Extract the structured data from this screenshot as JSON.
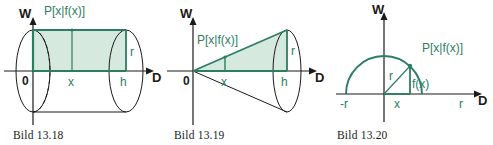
{
  "page": {
    "background": "#ffffff",
    "width": 493,
    "height": 145
  },
  "style": {
    "green_stroke": "#2d7d62",
    "green_fill": "#d6e9df",
    "black_stroke": "#1a1a1a"
  },
  "figures": [
    {
      "id": "cylinder",
      "caption": "Bild 13.18",
      "axis_vertical_label": "W",
      "axis_horizontal_label": "D",
      "origin_label": "0",
      "point_label": "P[x|f(x)]",
      "x_label": "x",
      "h_label": "h",
      "r_label": "r",
      "shape": "cylinder"
    },
    {
      "id": "cone",
      "caption": "Bild 13.19",
      "axis_vertical_label": "W",
      "axis_horizontal_label": "D",
      "origin_label": "0",
      "point_label": "P[x|f(x)]",
      "x_label": "x",
      "h_label": "h",
      "r_label": "r",
      "shape": "cone"
    },
    {
      "id": "circle",
      "caption": "Bild 13.20",
      "axis_vertical_label": "W",
      "axis_horizontal_label": "D",
      "point_label": "P[x|f(x)]",
      "x_label": "x",
      "r_label": "r",
      "neg_r_label": "-r",
      "r_right_label": "r",
      "fx_label": "f(x)",
      "shape": "semicircle"
    }
  ]
}
